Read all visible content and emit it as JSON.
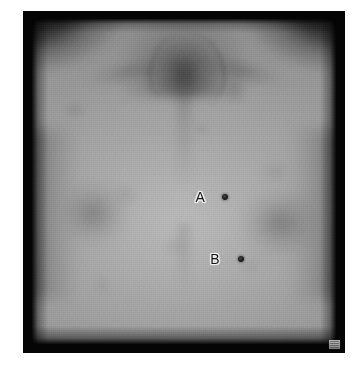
{
  "figure": {
    "kind": "clinical-photograph",
    "modality": "grayscale clinical photograph",
    "subject_region": "anterior chest and upper trunk",
    "view": "frontal",
    "border_color": "#050505",
    "page_background": "#ffffff"
  },
  "annotations": {
    "markers": [
      {
        "id": "A",
        "label": "A",
        "label_x_pct": 55.3,
        "label_y_pct": 54.8,
        "lesion_x_pct": 63.5,
        "lesion_y_pct": 54.8,
        "lesion_diameter_px": 6,
        "description": "small pigmented lesion"
      },
      {
        "id": "B",
        "label": "B",
        "label_x_pct": 60.2,
        "label_y_pct": 73.8,
        "lesion_x_pct": 68.8,
        "lesion_y_pct": 73.8,
        "lesion_diameter_px": 6,
        "description": "small pigmented lesion"
      }
    ],
    "label_text_color": "#111111",
    "label_outline_color": "#f2f2f2",
    "lesion_color": "#1a1a1a"
  },
  "corner_mark": {
    "name": "print-corner-mark",
    "color": "#c6c6c6"
  }
}
